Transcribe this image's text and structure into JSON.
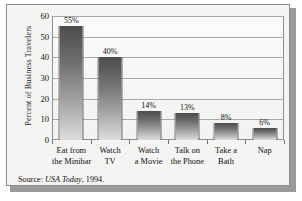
{
  "chart_data": {
    "type": "bar",
    "title": "",
    "xlabel": "",
    "ylabel": "Percent of Business Travelers",
    "ylabel_lines": [
      "Percent of Business",
      "Travelers"
    ],
    "ylim": [
      0,
      60
    ],
    "yticks": [
      0,
      10,
      20,
      30,
      40,
      50,
      60
    ],
    "ytick_labels": [
      "0",
      "10",
      "20",
      "30",
      "40",
      "50",
      "60"
    ],
    "grid": true,
    "legend": "none",
    "categories": [
      "Eat from the Minibar",
      "Watch TV",
      "Watch a Movie",
      "Talk on the Phone",
      "Take a Bath",
      "Nap"
    ],
    "category_lines": [
      [
        "Eat from",
        "the Minibar"
      ],
      [
        "Watch",
        "TV"
      ],
      [
        "Watch",
        "a Movie"
      ],
      [
        "Talk on",
        "the Phone"
      ],
      [
        "Take a",
        "Bath"
      ],
      [
        "Nap",
        ""
      ]
    ],
    "values": [
      55,
      40,
      14,
      13,
      8,
      6
    ],
    "data_labels": [
      "55%",
      "40%",
      "14%",
      "13%",
      "8%",
      "6%"
    ],
    "bar_color_top": "#4c4c4c",
    "bar_color_bottom": "#dcdcdc"
  },
  "source": {
    "prefix": "Source: ",
    "publication": "USA Today",
    "suffix": ", 1994."
  }
}
